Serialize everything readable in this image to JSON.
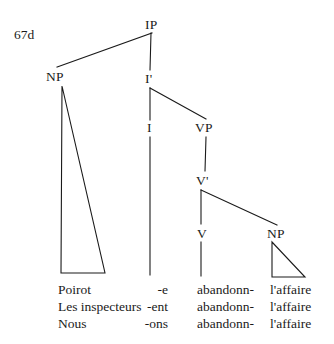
{
  "figure": {
    "example_number": "67d",
    "ink_color": "#1a1a1a",
    "background_color": "#ffffff"
  },
  "nodes": {
    "ip": "IP",
    "np_subject": "NP",
    "i_bar": "I'",
    "i_head": "I",
    "vp": "VP",
    "v_bar": "V'",
    "v_head": "V",
    "np_object": "NP"
  },
  "columns": {
    "subject": "subject",
    "inflection": "inflection",
    "verb": "verb",
    "object": "object"
  },
  "rows": [
    {
      "subject": "Poirot",
      "inflection": "-e",
      "verb": "abandonn-",
      "object": "l'affaire"
    },
    {
      "subject": "Les inspecteurs",
      "inflection": "-ent",
      "verb": "abandonn-",
      "object": "l'affaire"
    },
    {
      "subject": "Nous",
      "inflection": "-ons",
      "verb": "abandonn-",
      "object": "l'affaire"
    }
  ]
}
